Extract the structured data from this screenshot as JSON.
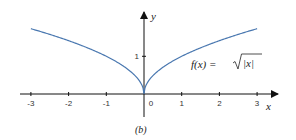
{
  "chart_data": {
    "type": "line",
    "title": "",
    "caption": "(b)",
    "xlabel": "x",
    "ylabel": "y",
    "function_label": "f(x) = √|x|",
    "function_label_parts": {
      "lhs": "f(x) = ",
      "radicand": "|x|"
    },
    "xlim": [
      -3,
      3
    ],
    "ylim": [
      0,
      1.732
    ],
    "x_ticks": [
      -3,
      -2,
      -1,
      0,
      1,
      2,
      3
    ],
    "x_tick_labels": [
      "-3",
      "-2",
      "-1",
      "0",
      "1",
      "2",
      "3"
    ],
    "y_ticks": [
      1
    ],
    "y_tick_labels": [
      "1"
    ],
    "grid": false,
    "legend": null,
    "series": [
      {
        "name": "f(x) = √|x|",
        "color": "#4a78b0",
        "x": [
          -3,
          -2.5,
          -2,
          -1.5,
          -1,
          -0.5,
          -0.25,
          -0.1,
          0,
          0.1,
          0.25,
          0.5,
          1,
          1.5,
          2,
          2.5,
          3
        ],
        "y": [
          1.732,
          1.581,
          1.414,
          1.225,
          1.0,
          0.707,
          0.5,
          0.316,
          0,
          0.316,
          0.5,
          0.707,
          1.0,
          1.225,
          1.414,
          1.581,
          1.732
        ]
      }
    ]
  },
  "colors": {
    "axis": "#111111",
    "curve": "#4a78b0"
  },
  "layout": {
    "origin_px": [
      144,
      94
    ],
    "unit_px": 37.7
  }
}
